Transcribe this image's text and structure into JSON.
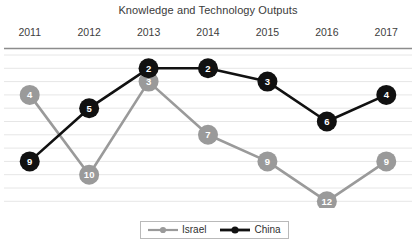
{
  "chart_data": {
    "type": "line",
    "title": "Knowledge and Technology Outputs",
    "xlabel": "",
    "ylabel": "",
    "categories": [
      "2011",
      "2012",
      "2013",
      "2014",
      "2015",
      "2016",
      "2017"
    ],
    "series": [
      {
        "name": "Israel",
        "color": "#9a9a9a",
        "label_color": "#ffffff",
        "values": [
          4,
          10,
          3,
          7,
          9,
          12,
          9
        ]
      },
      {
        "name": "China",
        "color": "#111111",
        "label_color": "#ffffff",
        "values": [
          9,
          5,
          2,
          2,
          3,
          6,
          4
        ]
      }
    ],
    "y_axis": {
      "inverted": true,
      "description": "rank (1 = best, shown top to bottom)",
      "ylim": [
        1,
        13
      ],
      "tick_values": [
        1,
        2,
        3,
        4,
        5,
        6,
        7,
        8,
        9,
        10,
        11,
        12,
        13
      ],
      "tick_labels_visible": false
    },
    "grid": {
      "horizontal": true,
      "vertical": false,
      "color": "#e6e6e6",
      "axis_line_color": "#8c8c8c"
    },
    "legend": {
      "position": "bottom-center",
      "entries": [
        "Israel",
        "China"
      ]
    },
    "annotations": {
      "point_labels": "Each marker is labeled with its rank value"
    }
  },
  "legend": {
    "israel_label": "Israel",
    "china_label": "China"
  }
}
